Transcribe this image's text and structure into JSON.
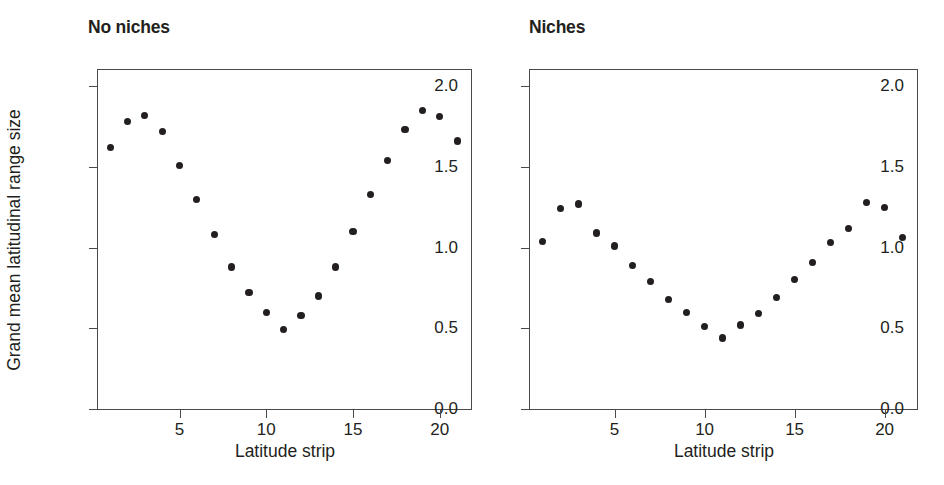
{
  "figure": {
    "background_color": "#ffffff",
    "marker_color": "#231f20",
    "axis_color": "#4a4a4a"
  },
  "panels": [
    {
      "id": "no-niches",
      "title": "No niches",
      "xlabel": "Latitude strip",
      "ylabel": "Grand mean latitudinal range size"
    },
    {
      "id": "niches",
      "title": "Niches",
      "xlabel": "Latitude strip",
      "ylabel": ""
    }
  ],
  "axes": {
    "y_ticks": [
      "0.0",
      "0.5",
      "1.0",
      "1.5",
      "2.0"
    ],
    "y_tick_values": [
      0.0,
      0.5,
      1.0,
      1.5,
      2.0
    ],
    "x_ticks": [
      "5",
      "10",
      "15",
      "20"
    ],
    "x_tick_values": [
      5,
      10,
      15,
      20
    ]
  },
  "chart_data": [
    {
      "type": "scatter",
      "title": "No niches",
      "xlabel": "Latitude strip",
      "ylabel": "Grand mean latitudinal range size",
      "xlim": [
        0.3,
        21.8
      ],
      "ylim": [
        0.0,
        2.1
      ],
      "grid": false,
      "legend": "none",
      "x": [
        1,
        2,
        3,
        4,
        5,
        6,
        7,
        8,
        9,
        10,
        11,
        12,
        13,
        14,
        15,
        16,
        17,
        18,
        19,
        20,
        21
      ],
      "y": [
        1.62,
        1.78,
        1.82,
        1.72,
        1.51,
        1.3,
        1.08,
        0.88,
        0.72,
        0.6,
        0.49,
        0.58,
        0.7,
        0.88,
        1.1,
        1.33,
        1.54,
        1.73,
        1.85,
        1.81,
        1.66
      ]
    },
    {
      "type": "scatter",
      "title": "Niches",
      "xlabel": "Latitude strip",
      "ylabel": "",
      "xlim": [
        0.3,
        21.8
      ],
      "ylim": [
        0.0,
        2.1
      ],
      "grid": false,
      "legend": "none",
      "x": [
        1,
        2,
        3,
        4,
        5,
        6,
        7,
        8,
        9,
        10,
        11,
        12,
        13,
        14,
        15,
        16,
        17,
        18,
        19,
        20,
        21
      ],
      "y": [
        1.04,
        1.24,
        1.27,
        1.09,
        1.01,
        0.89,
        0.79,
        0.68,
        0.6,
        0.51,
        0.44,
        0.52,
        0.59,
        0.69,
        0.8,
        0.91,
        1.03,
        1.12,
        1.28,
        1.25,
        1.06
      ]
    }
  ]
}
